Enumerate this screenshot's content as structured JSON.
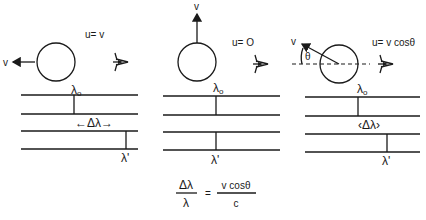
{
  "diagram": {
    "panels": [
      {
        "id": "receding",
        "velocity_label": "v",
        "relation": "u= v",
        "emitted_label": "λ",
        "emitted_sub": "o",
        "shift_label": "←Δλ→",
        "observed_label": "λ'",
        "observer": "eye-icon"
      },
      {
        "id": "transverse",
        "velocity_label": "v",
        "relation": "u= O",
        "emitted_label": "λ",
        "emitted_sub": "o",
        "shift_label": "",
        "observed_label": "λ'",
        "observer": "eye-icon"
      },
      {
        "id": "oblique",
        "velocity_label": "v",
        "angle_label": "θ",
        "relation": "u= v cosθ",
        "emitted_label": "λ",
        "emitted_sub": "o",
        "shift_label": "‹Δλ›",
        "observed_label": "λ'",
        "observer": "eye-icon"
      }
    ],
    "equation": {
      "lhs_num": "Δλ",
      "lhs_den": "λ",
      "equals": "=",
      "rhs_num": "v cosθ",
      "rhs_den": "c"
    }
  }
}
